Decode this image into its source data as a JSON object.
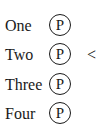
{
  "items": [
    {
      "label": "One",
      "badge": "P",
      "marker": ""
    },
    {
      "label": "Two",
      "badge": "P",
      "marker": "<"
    },
    {
      "label": "Three",
      "badge": "P",
      "marker": ""
    },
    {
      "label": "Four",
      "badge": "P",
      "marker": ""
    }
  ]
}
